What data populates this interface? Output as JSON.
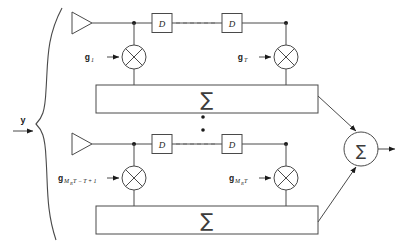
{
  "figure": {
    "background_color": "#ffffff",
    "line_color": "#4a4a4a",
    "text_color": "#1a1a1a"
  },
  "input": {
    "label": "y",
    "arrow_name": "input-arrow"
  },
  "branches": [
    {
      "id": "top",
      "amplifier_name": "antenna-amplifier-top",
      "delay_blocks": [
        {
          "label": "D"
        },
        {
          "label": "D"
        }
      ],
      "dashed_continuation": true,
      "multipliers": [
        {
          "gain_label": "g",
          "gain_subscript": "1",
          "gain_subscript_small": ""
        },
        {
          "gain_label": "g",
          "gain_subscript": "T",
          "gain_subscript_small": ""
        }
      ],
      "summation_label": "∑"
    },
    {
      "id": "bottom",
      "amplifier_name": "antenna-amplifier-bottom",
      "delay_blocks": [
        {
          "label": "D"
        },
        {
          "label": "D"
        }
      ],
      "dashed_continuation": true,
      "multipliers": [
        {
          "gain_label": "g",
          "gain_subscript": "M",
          "gain_subscript_small": "R",
          "gain_subscript_tail": "T − T + 1"
        },
        {
          "gain_label": "g",
          "gain_subscript": "M",
          "gain_subscript_small": "R",
          "gain_subscript_tail": "T"
        }
      ],
      "summation_label": "∑"
    }
  ],
  "vertical_ellipsis": {
    "name": "branch-ellipsis",
    "dot_count": 2
  },
  "output_adder": {
    "label": "∑",
    "name": "output-summer"
  }
}
